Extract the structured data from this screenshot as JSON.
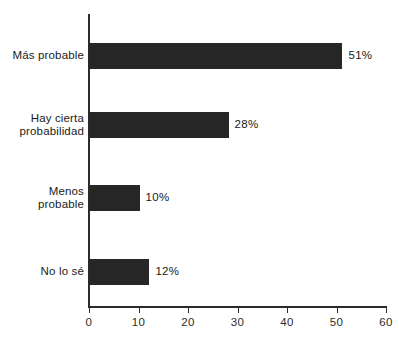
{
  "chart_data": {
    "type": "bar",
    "orientation": "horizontal",
    "title": "",
    "subtitle": "",
    "xlabel": "",
    "ylabel": "",
    "categories": [
      "Más probable",
      "Hay cierta\nprobabilidad",
      "Menos\nprobable",
      "No lo sé"
    ],
    "values": [
      51,
      28,
      10,
      12
    ],
    "value_labels": [
      "51%",
      "28%",
      "10%",
      "12%"
    ],
    "xlim": [
      0,
      60
    ],
    "xticks": [
      0,
      10,
      20,
      30,
      40,
      50,
      60
    ],
    "xtick_labels": [
      "0",
      "10",
      "20",
      "30",
      "40",
      "50",
      "60"
    ],
    "grid": false,
    "legend": false,
    "bar_color": "#262626",
    "axis_color": "#2b2b2b",
    "background_color": "#ffffff",
    "text_color": "#1a1a1a"
  }
}
